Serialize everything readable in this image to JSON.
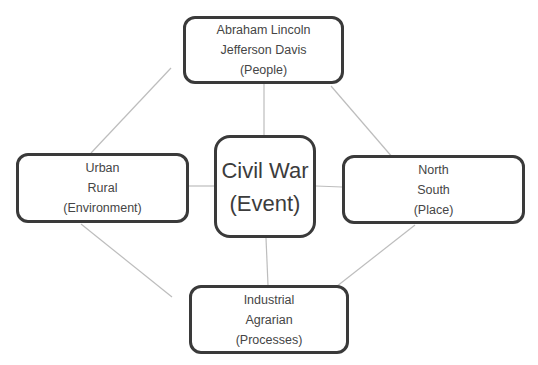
{
  "diagram": {
    "type": "concept-map",
    "center": {
      "lines": [
        "Civil War",
        "(Event)"
      ]
    },
    "nodes": {
      "top": {
        "lines": [
          "Abraham Lincoln",
          "Jefferson Davis",
          "(People)"
        ]
      },
      "left": {
        "lines": [
          "Urban",
          "Rural",
          "(Environment)"
        ]
      },
      "right": {
        "lines": [
          "North",
          "South",
          "(Place)"
        ]
      },
      "bottom": {
        "lines": [
          "Industrial",
          "Agrarian",
          "(Processes)"
        ]
      }
    },
    "connections": [
      {
        "from": "center",
        "to": "top"
      },
      {
        "from": "center",
        "to": "left"
      },
      {
        "from": "center",
        "to": "right"
      },
      {
        "from": "center",
        "to": "bottom"
      },
      {
        "from": "top",
        "to": "left"
      },
      {
        "from": "top",
        "to": "right"
      },
      {
        "from": "left",
        "to": "bottom"
      },
      {
        "from": "right",
        "to": "bottom"
      }
    ],
    "colors": {
      "border": "#3a3a3a",
      "connector": "#bdbdbd",
      "text": "#454545",
      "background": "#ffffff"
    }
  }
}
